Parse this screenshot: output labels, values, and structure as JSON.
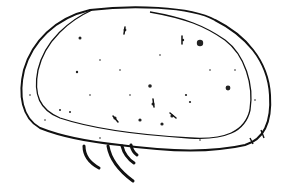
{
  "figure": {
    "subject": "ostracod carapace line drawing",
    "background": "#ffffff",
    "ink": "#111111",
    "view": "lateral",
    "appendages_visible": 4,
    "spines_posterior": 2
  }
}
